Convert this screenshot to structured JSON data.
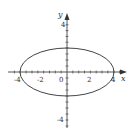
{
  "diagram": {
    "type": "ellipse-plot",
    "equation": "x^2/16 + y^2/4 = 1",
    "x_axis": {
      "label": "x",
      "ticks": [
        "-4",
        "-2",
        "0",
        "2",
        "4"
      ]
    },
    "y_axis": {
      "label": "y",
      "ticks": [
        "4",
        "-4"
      ]
    },
    "ellipse": {
      "semi_major_x": 4,
      "semi_minor_y": 2,
      "center": [
        0,
        0
      ]
    },
    "colors": {
      "stroke": "#444444",
      "text": "#333333",
      "background": "#ffffff"
    }
  },
  "labels": {
    "x_axis": "x",
    "y_axis": "y",
    "x_neg4": "-4",
    "x_neg2": "-2",
    "origin": "0",
    "x_2": "2",
    "x_4": "4",
    "y_4": "4",
    "y_neg4": "-4"
  }
}
